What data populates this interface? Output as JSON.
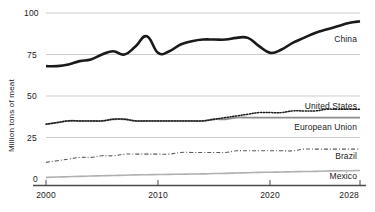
{
  "chart_data": {
    "type": "line",
    "title": "",
    "subtitle": "",
    "xlabel": "",
    "ylabel": "Million tons of meat",
    "xlim": [
      2000,
      2028
    ],
    "ylim": [
      0,
      100
    ],
    "grid": true,
    "legend_position": "right-inline",
    "x_ticks": [
      "2000",
      "2010",
      "2020",
      "2028"
    ],
    "x_tick_values": [
      2000,
      2010,
      2020,
      2028
    ],
    "y_ticks": [
      "0",
      "25",
      "50",
      "75",
      "100"
    ],
    "y_tick_values": [
      0,
      25,
      50,
      75,
      100
    ],
    "x": [
      2000,
      2001,
      2002,
      2003,
      2004,
      2005,
      2006,
      2007,
      2008,
      2009,
      2010,
      2011,
      2012,
      2013,
      2014,
      2015,
      2016,
      2017,
      2018,
      2019,
      2020,
      2021,
      2022,
      2023,
      2024,
      2025,
      2026,
      2027,
      2028
    ],
    "series": [
      {
        "name": "China",
        "style": "solid-thick-black",
        "color": "#1a1a1a",
        "values": [
          68,
          68,
          69,
          71,
          72,
          75,
          77,
          75,
          80,
          86,
          76,
          77,
          81,
          83,
          84,
          84,
          84,
          85,
          85,
          80,
          76,
          78,
          82,
          85,
          88,
          90,
          92,
          94,
          95
        ]
      },
      {
        "name": "United States",
        "style": "dotted",
        "color": "#1a1a1a",
        "values": [
          33,
          34,
          35,
          35,
          35,
          35,
          36,
          36,
          35,
          35,
          35,
          35,
          35,
          35,
          35,
          36,
          37,
          38,
          39,
          40,
          40,
          40,
          41,
          41,
          41,
          42,
          42,
          42,
          42
        ]
      },
      {
        "name": "European Union",
        "style": "solid-gray",
        "color": "#8c8c8c",
        "values": [
          33,
          34,
          35,
          35,
          35,
          35,
          36,
          36,
          35,
          35,
          35,
          35,
          35,
          35,
          35,
          36,
          36,
          37,
          37,
          37,
          37,
          37,
          37,
          37,
          37,
          37,
          37,
          37,
          37
        ]
      },
      {
        "name": "Brazil",
        "style": "dash-dot",
        "color": "#5a5a5a",
        "values": [
          10,
          11,
          12,
          13,
          13,
          14,
          14,
          15,
          15,
          15,
          15,
          15,
          16,
          16,
          16,
          16,
          16,
          17,
          17,
          17,
          17,
          17,
          17,
          18,
          18,
          18,
          18,
          18,
          18
        ]
      },
      {
        "name": "Mexico",
        "style": "solid-light-gray",
        "color": "#b0b0b0",
        "values": [
          1,
          1.2,
          1.4,
          1.6,
          1.8,
          2,
          2.1,
          2.3,
          2.5,
          2.6,
          2.7,
          2.8,
          2.9,
          3.0,
          3.1,
          3.3,
          3.4,
          3.6,
          3.8,
          4.0,
          4.1,
          4.2,
          4.4,
          4.5,
          4.6,
          4.8,
          4.9,
          5.0,
          5.1
        ]
      }
    ],
    "series_labels": [
      {
        "name": "China",
        "text": "China"
      },
      {
        "name": "United States",
        "text": "United States"
      },
      {
        "name": "European Union",
        "text": "European Union"
      },
      {
        "name": "Brazil",
        "text": "Brazil"
      },
      {
        "name": "Mexico",
        "text": "Mexico"
      }
    ]
  }
}
